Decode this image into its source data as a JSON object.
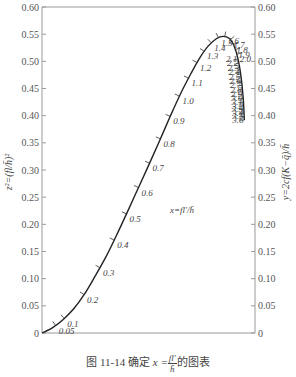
{
  "chart_data": {
    "type": "line",
    "xlabel": "",
    "ylabel": "z²=(fl/h̄)²",
    "ylabel_right": "y=2cf(K−q̄)/h̄",
    "curve_label": "x=fl'/h̄",
    "ylim": [
      0,
      0.6
    ],
    "yticks": [
      0,
      0.05,
      0.1,
      0.15,
      0.2,
      0.25,
      0.3,
      0.35,
      0.4,
      0.45,
      0.5,
      0.55,
      0.6
    ],
    "ytick_labels": [
      "0",
      "0.05",
      "0.10",
      "0.15",
      "0.20",
      "0.25",
      "0.30",
      "0.35",
      "0.40",
      "0.45",
      "0.50",
      "0.55",
      "0.60"
    ],
    "grid": false,
    "legend": "none",
    "curve_points_normalized": [
      [
        0.0,
        0.0
      ],
      [
        0.05,
        0.01
      ],
      [
        0.1,
        0.025
      ],
      [
        0.15,
        0.045
      ],
      [
        0.2,
        0.072
      ],
      [
        0.25,
        0.105
      ],
      [
        0.3,
        0.14
      ],
      [
        0.35,
        0.18
      ],
      [
        0.4,
        0.222
      ],
      [
        0.45,
        0.265
      ],
      [
        0.5,
        0.308
      ],
      [
        0.55,
        0.352
      ],
      [
        0.6,
        0.397
      ],
      [
        0.65,
        0.44
      ],
      [
        0.7,
        0.478
      ],
      [
        0.74,
        0.506
      ],
      [
        0.78,
        0.528
      ],
      [
        0.82,
        0.542
      ],
      [
        0.85,
        0.546
      ],
      [
        0.88,
        0.542
      ],
      [
        0.9,
        0.53
      ],
      [
        0.92,
        0.505
      ],
      [
        0.935,
        0.47
      ],
      [
        0.945,
        0.43
      ],
      [
        0.95,
        0.392
      ]
    ],
    "x_param_labels": [
      "0.05",
      "0.1",
      "0.2",
      "0.3",
      "0.4",
      "0.5",
      "0.6",
      "0.7",
      "0.8",
      "0.9",
      "1.0",
      "1.1",
      "1.2",
      "1.3",
      "1.4",
      "1.5",
      "1.6",
      "1.7",
      "1.8",
      "1.9",
      "2.0",
      "2.1",
      "2.2",
      "2.3",
      "2.4",
      "2.5",
      "2.6",
      "2.7",
      "2.8",
      "2.9",
      "3.0",
      "3.1",
      "3.2",
      "3.3",
      "3.4",
      "3.5",
      "3.6"
    ]
  },
  "caption": {
    "prefix": "图 11-14    确定 ",
    "var": "x =",
    "numerator": "fl'",
    "denominator": "h̄",
    "suffix": "的图表"
  }
}
